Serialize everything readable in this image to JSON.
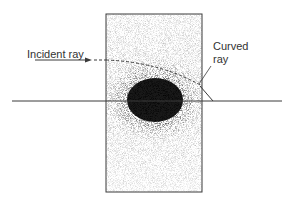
{
  "diagram": {
    "labels": {
      "incident_ray": "Incident ray",
      "curved_ray_line1": "Curved",
      "curved_ray_line2": "ray"
    },
    "colors": {
      "stroke": "#3a3a3a",
      "background": "#ffffff",
      "dense_core": "#000000"
    },
    "elements": {
      "medium_block": "rectangle of graded-density medium",
      "axis": "horizontal reference line",
      "dense_region": "high-density region centered below ray"
    }
  }
}
